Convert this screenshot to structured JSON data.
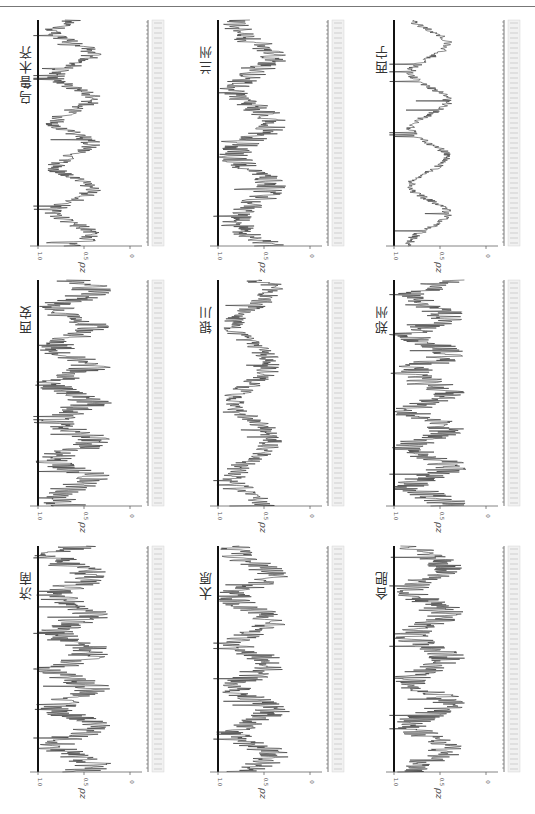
{
  "header": {
    "running_text": "",
    "page_number": ""
  },
  "figure": {
    "orientation": "rotated-90",
    "axis_label": "ρz",
    "y_ticks": [
      "1.0",
      "0.5",
      "0"
    ],
    "x_axis": "years (dense tick labels, illegible)",
    "panels": [
      {
        "title": "乌鲁木齐",
        "row": 0,
        "col": 0
      },
      {
        "title": "兰州",
        "row": 0,
        "col": 1
      },
      {
        "title": "西宁",
        "row": 0,
        "col": 2
      },
      {
        "title": "西安",
        "row": 1,
        "col": 0
      },
      {
        "title": "银川",
        "row": 1,
        "col": 1
      },
      {
        "title": "郑州",
        "row": 1,
        "col": 2
      },
      {
        "title": "济南",
        "row": 2,
        "col": 0
      },
      {
        "title": "太原",
        "row": 2,
        "col": 1
      },
      {
        "title": "合肥",
        "row": 2,
        "col": 2
      }
    ]
  },
  "chart_data": [
    {
      "type": "line",
      "title": "乌鲁木齐",
      "ylabel": "ρz",
      "ylim": [
        0,
        1.0
      ],
      "yticks": [
        0,
        0.5,
        1.0
      ],
      "pattern": "periodic dips toward ~0.3-0.4 with 5 peaks near 1.0"
    },
    {
      "type": "line",
      "title": "兰州",
      "ylabel": "ρz",
      "ylim": [
        0,
        1.0
      ],
      "yticks": [
        0,
        0.5,
        1.0
      ],
      "pattern": "noisy, mostly 0.4-0.9 with several bursts near 1.0"
    },
    {
      "type": "line",
      "title": "西宁",
      "ylabel": "ρz",
      "ylim": [
        0,
        1.0
      ],
      "yticks": [
        0,
        0.5,
        1.0
      ],
      "pattern": "smooth, 0.3-0.8, four broad peaks"
    },
    {
      "type": "line",
      "title": "西安",
      "ylabel": "ρz",
      "ylim": [
        0,
        1.0
      ],
      "yticks": [
        0,
        0.5,
        1.0
      ],
      "pattern": "dense noisy, 0.3-1.0"
    },
    {
      "type": "line",
      "title": "银川",
      "ylabel": "ρz",
      "ylim": [
        0,
        1.0
      ],
      "yticks": [
        0,
        0.5,
        1.0
      ],
      "pattern": "wavy, 0.3-0.9"
    },
    {
      "type": "line",
      "title": "郑州",
      "ylabel": "ρz",
      "ylim": [
        0,
        1.0
      ],
      "yticks": [
        0,
        0.5,
        1.0
      ],
      "pattern": "dense noisy, 0.3-1.0"
    },
    {
      "type": "line",
      "title": "济南",
      "ylabel": "ρz",
      "ylim": [
        0,
        1.0
      ],
      "yticks": [
        0,
        0.5,
        1.0
      ],
      "pattern": "dense noisy, 0.3-1.0"
    },
    {
      "type": "line",
      "title": "太原",
      "ylabel": "ρz",
      "ylim": [
        0,
        1.0
      ],
      "yticks": [
        0,
        0.5,
        1.0
      ],
      "pattern": "noisy, 0.3-1.0"
    },
    {
      "type": "line",
      "title": "合肥",
      "ylabel": "ρz",
      "ylim": [
        0,
        1.0
      ],
      "yticks": [
        0,
        0.5,
        1.0
      ],
      "pattern": "noisy, 0.3-1.0 with dips"
    }
  ]
}
